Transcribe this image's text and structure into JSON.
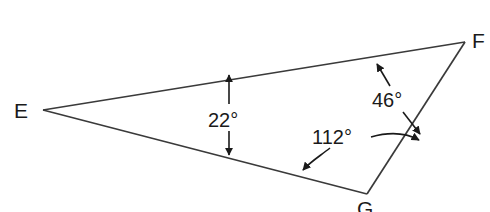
{
  "figure": {
    "type": "triangle-angle-diagram",
    "background_color": "#ffffff",
    "line_color": "#3a3a3a",
    "text_color": "#1a1a1a",
    "vertices": [
      {
        "id": "E",
        "label": "E",
        "x": 43,
        "y": 110,
        "label_x": 14,
        "label_y": 118
      },
      {
        "id": "F",
        "label": "F",
        "x": 465,
        "y": 42,
        "label_x": 472,
        "label_y": 48
      },
      {
        "id": "G",
        "label": "G",
        "x": 367,
        "y": 194,
        "label_x": 357,
        "label_y": 216
      }
    ],
    "sides": [
      {
        "from": "E",
        "to": "F"
      },
      {
        "from": "F",
        "to": "G"
      },
      {
        "from": "G",
        "to": "E"
      }
    ],
    "angles": [
      {
        "at_vertex": "E",
        "value": 22,
        "label": "22°",
        "label_x": 208,
        "label_y": 127,
        "leader_style": "straight-double-arrow-vertical"
      },
      {
        "at_vertex": "F",
        "value": 46,
        "label": "46°",
        "label_x": 372,
        "label_y": 107,
        "leader_style": "straight-double-arrow-diagonal"
      },
      {
        "at_vertex": "G",
        "value": 112,
        "label": "112°",
        "label_x": 312,
        "label_y": 144,
        "leader_style": "curved-double-arrow"
      }
    ]
  }
}
